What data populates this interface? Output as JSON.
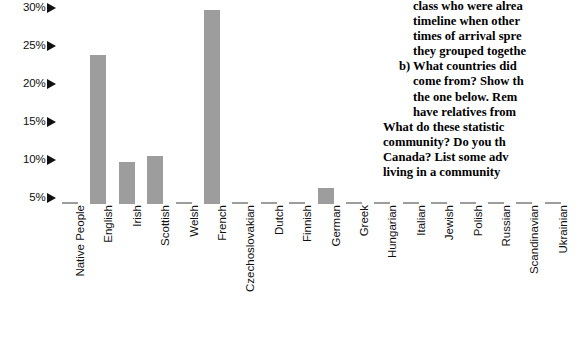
{
  "chart_data": {
    "type": "bar",
    "title": "",
    "xlabel": "",
    "ylabel": "",
    "ylim": [
      0,
      32
    ],
    "grid": false,
    "legend": null,
    "bar_color": "#9d9d9d",
    "y_ticks": [
      "5%",
      "10%",
      "15%",
      "20%",
      "25%",
      "30%"
    ],
    "y_tick_values": [
      5,
      10,
      15,
      20,
      25,
      30
    ],
    "y_tick_marker": "right-triangle",
    "categories": [
      "Native People",
      "English",
      "Irish",
      "Scottish",
      "Welsh",
      "French",
      "Czechoslovakian",
      "Dutch",
      "Finnish",
      "German",
      "Greek",
      "Hungarian",
      "Italian",
      "Jewish",
      "Polish",
      "Russian",
      "Scandinavian",
      "Ukrainian"
    ],
    "values": [
      2.2,
      23.8,
      9.8,
      10.5,
      0.9,
      29.8,
      0.5,
      3.0,
      0.3,
      6.3,
      0.6,
      0.6,
      3.8,
      1.9,
      2.1,
      0.4,
      2.3,
      2.9
    ]
  },
  "text_block": {
    "lines": [
      {
        "text": "class who were alrea",
        "indent": 2
      },
      {
        "text": "timeline when other",
        "indent": 2
      },
      {
        "text": "times of arrival spre",
        "indent": 2
      },
      {
        "text": "they grouped togethe",
        "indent": 2
      },
      {
        "text": "b) What countries did",
        "indent": 1
      },
      {
        "text": "come from? Show th",
        "indent": 2
      },
      {
        "text": "the one below. Rem",
        "indent": 2
      },
      {
        "text": "have relatives from",
        "indent": 2
      },
      {
        "text": "What do these statistic",
        "indent": 0
      },
      {
        "text": "community? Do you th",
        "indent": 0
      },
      {
        "text": "Canada? List some adv",
        "indent": 0
      },
      {
        "text": "living in a community",
        "indent": 0
      }
    ]
  }
}
